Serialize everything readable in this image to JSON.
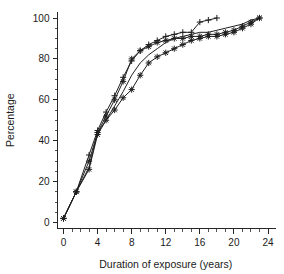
{
  "chart_data": {
    "type": "line",
    "title": "",
    "xlabel": "Duration of exposure (years)",
    "ylabel": "Percentage",
    "xlim": [
      -1,
      25
    ],
    "ylim": [
      -3,
      104
    ],
    "grid": false,
    "legend": "none",
    "x_ticks_major": [
      0,
      4,
      8,
      12,
      16,
      20,
      24
    ],
    "x_ticks_minor": [
      1,
      2,
      3,
      5,
      6,
      7,
      9,
      10,
      11,
      13,
      14,
      15,
      17,
      18,
      19,
      21,
      22,
      23
    ],
    "y_ticks_major": [
      0,
      20,
      40,
      60,
      80,
      100
    ],
    "y_ticks_minor": [
      5,
      10,
      15,
      25,
      30,
      35,
      45,
      50,
      55,
      65,
      70,
      75,
      85,
      90,
      95
    ],
    "x_tick_labels": [
      "0",
      "4",
      "8",
      "12",
      "16",
      "20",
      "24"
    ],
    "y_tick_labels": [
      "0",
      "20",
      "40",
      "60",
      "80",
      "100"
    ],
    "marker_colors": {
      "line": "#1f1f1f"
    },
    "series": [
      {
        "name": "series-plus-upper",
        "marker": "plus",
        "x": [
          0,
          1.5,
          3,
          4,
          5,
          6,
          7,
          8,
          9,
          10,
          11,
          12,
          13,
          14,
          15,
          16,
          17,
          18
        ],
        "y": [
          2,
          15,
          33,
          45,
          54,
          62,
          71,
          79,
          84,
          87,
          89,
          91,
          92,
          93,
          93,
          98,
          99,
          100
        ]
      },
      {
        "name": "series-middle-plain",
        "marker": "none",
        "x": [
          0,
          1.5,
          3,
          4,
          5,
          6,
          7,
          8,
          9,
          10,
          11,
          12,
          13,
          14,
          15,
          16,
          17,
          18,
          19,
          20,
          21,
          22,
          23
        ],
        "y": [
          2,
          15,
          27,
          44,
          50,
          57,
          64,
          72,
          78,
          82,
          85,
          88,
          90,
          91,
          92,
          93,
          93,
          94,
          95,
          96,
          97,
          99,
          100
        ]
      },
      {
        "name": "series-star-lower",
        "marker": "star",
        "x": [
          0,
          1.5,
          3,
          4,
          5,
          6,
          7,
          8,
          9,
          10,
          11,
          12,
          13,
          14,
          15,
          16,
          17,
          18,
          19,
          20,
          21,
          22,
          23
        ],
        "y": [
          2,
          15,
          26,
          43,
          50,
          55,
          61,
          65,
          72,
          78,
          81,
          83,
          85,
          87,
          89,
          90,
          91,
          91,
          92,
          93,
          95,
          97,
          100
        ]
      },
      {
        "name": "series-star-upper",
        "marker": "star",
        "x": [
          0,
          1.5,
          3,
          4,
          5,
          6,
          7,
          8,
          9,
          10,
          11,
          12,
          13,
          14,
          15,
          16,
          17,
          18,
          19,
          20,
          21,
          22,
          23
        ],
        "y": [
          2,
          15,
          30,
          44,
          52,
          60,
          69,
          80,
          84,
          86,
          88,
          89,
          90,
          90,
          91,
          91,
          92,
          92,
          93,
          94,
          96,
          98,
          100
        ]
      }
    ]
  }
}
